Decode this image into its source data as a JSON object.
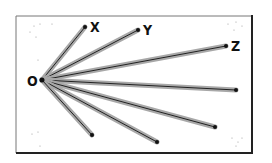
{
  "diagram": {
    "frame": {
      "x": 16,
      "y": 16,
      "width": 236,
      "height": 137
    },
    "origin": {
      "label": "O",
      "x": 42,
      "y": 80
    },
    "rays": [
      {
        "name": "X",
        "label": "X",
        "end": [
          85,
          27
        ]
      },
      {
        "name": "Y",
        "label": "Y",
        "end": [
          138,
          30
        ]
      },
      {
        "name": "Z",
        "label": "Z",
        "end": [
          226,
          46
        ]
      },
      {
        "name": "ray-4",
        "label": "",
        "end": [
          236,
          90
        ]
      },
      {
        "name": "ray-5",
        "label": "",
        "end": [
          215,
          127
        ]
      },
      {
        "name": "ray-6",
        "label": "",
        "end": [
          157,
          142
        ]
      },
      {
        "name": "ray-7",
        "label": "",
        "end": [
          92,
          135
        ]
      }
    ],
    "colors": {
      "ray_shadow": "#a8a8a8",
      "ray_core": "#222222",
      "frame": "#333333"
    }
  }
}
